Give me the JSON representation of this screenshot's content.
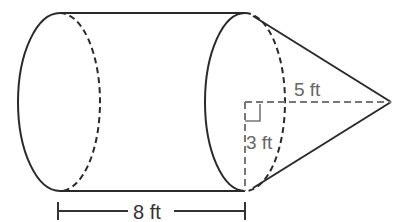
{
  "figure": {
    "shape": "cylinder with cone attached",
    "labels": {
      "cylinder_length": "8 ft",
      "cone_height": "5 ft",
      "radius": "3 ft"
    },
    "colors": {
      "outline": "#2a2a2a",
      "dashed": "#555555",
      "label": "#666666",
      "dimension": "#333333"
    }
  }
}
